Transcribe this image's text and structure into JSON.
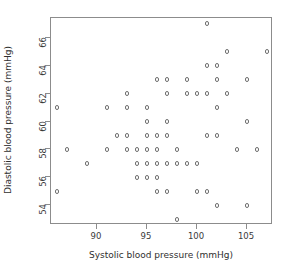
{
  "chart_data": {
    "type": "scatter",
    "title": "",
    "xlabel": "Systolic blood pressure (mmHg)",
    "ylabel": "Diastolic blood pressure (mmHg)",
    "xlim": [
      85.4,
      107.6
    ],
    "ylim": [
      52.6,
      67.4
    ],
    "xticks": [
      90,
      95,
      100,
      105
    ],
    "yticks": [
      54,
      56,
      58,
      60,
      62,
      64,
      66
    ],
    "xtick_labels": [
      "90",
      "95",
      "100",
      "105"
    ],
    "ytick_labels": [
      "54",
      "56",
      "58",
      "60",
      "62",
      "64",
      "66"
    ],
    "grid": false,
    "legend": false,
    "marker": "open-circle",
    "marker_color": "#6f6f6f",
    "frame_color": "#8c8c8c",
    "background": "#ffffff",
    "n_points": 96,
    "points": [
      {
        "x": 86,
        "y": 61
      },
      {
        "x": 86,
        "y": 55
      },
      {
        "x": 87,
        "y": 58
      },
      {
        "x": 89,
        "y": 57
      },
      {
        "x": 91,
        "y": 61
      },
      {
        "x": 91,
        "y": 58
      },
      {
        "x": 92,
        "y": 59
      },
      {
        "x": 93,
        "y": 62
      },
      {
        "x": 93,
        "y": 61
      },
      {
        "x": 93,
        "y": 59
      },
      {
        "x": 93,
        "y": 58
      },
      {
        "x": 94,
        "y": 58
      },
      {
        "x": 94,
        "y": 57
      },
      {
        "x": 94,
        "y": 56
      },
      {
        "x": 95,
        "y": 61
      },
      {
        "x": 95,
        "y": 60
      },
      {
        "x": 95,
        "y": 59
      },
      {
        "x": 95,
        "y": 58
      },
      {
        "x": 95,
        "y": 57
      },
      {
        "x": 95,
        "y": 56
      },
      {
        "x": 96,
        "y": 63
      },
      {
        "x": 96,
        "y": 59
      },
      {
        "x": 96,
        "y": 58
      },
      {
        "x": 96,
        "y": 57
      },
      {
        "x": 96,
        "y": 56
      },
      {
        "x": 96,
        "y": 55
      },
      {
        "x": 97,
        "y": 63
      },
      {
        "x": 97,
        "y": 62
      },
      {
        "x": 97,
        "y": 60
      },
      {
        "x": 97,
        "y": 59
      },
      {
        "x": 97,
        "y": 57
      },
      {
        "x": 97,
        "y": 55
      },
      {
        "x": 98,
        "y": 58
      },
      {
        "x": 98,
        "y": 57
      },
      {
        "x": 98,
        "y": 53
      },
      {
        "x": 99,
        "y": 63
      },
      {
        "x": 99,
        "y": 62
      },
      {
        "x": 99,
        "y": 57
      },
      {
        "x": 100,
        "y": 62
      },
      {
        "x": 100,
        "y": 57
      },
      {
        "x": 100,
        "y": 55
      },
      {
        "x": 101,
        "y": 67
      },
      {
        "x": 101,
        "y": 64
      },
      {
        "x": 101,
        "y": 62
      },
      {
        "x": 101,
        "y": 59
      },
      {
        "x": 101,
        "y": 55
      },
      {
        "x": 102,
        "y": 64
      },
      {
        "x": 102,
        "y": 63
      },
      {
        "x": 102,
        "y": 61
      },
      {
        "x": 102,
        "y": 59
      },
      {
        "x": 102,
        "y": 54
      },
      {
        "x": 103,
        "y": 65
      },
      {
        "x": 103,
        "y": 62
      },
      {
        "x": 104,
        "y": 58
      },
      {
        "x": 105,
        "y": 63
      },
      {
        "x": 105,
        "y": 60
      },
      {
        "x": 105,
        "y": 54
      },
      {
        "x": 106,
        "y": 58
      },
      {
        "x": 107,
        "y": 65
      }
    ]
  }
}
